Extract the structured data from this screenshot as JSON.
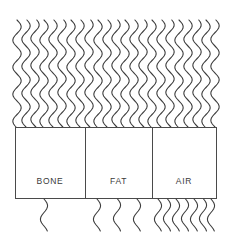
{
  "figure": {
    "type": "attenuation-diagram",
    "background_color": "#ffffff",
    "stroke_color": "#3d3d3d",
    "box_stroke_color": "#4a4a4a",
    "label_color": "#3a3a3a",
    "width": 235,
    "height": 233
  },
  "incident_beam": {
    "name": "incident-wavy-rays",
    "ray_count": 23,
    "x_start": 17,
    "x_end": 215,
    "y_top": 20,
    "y_bottom": 127,
    "wavelength": 27,
    "amplitude": 4.2
  },
  "materials": [
    {
      "label": "BONE",
      "x": 15,
      "width": 70,
      "transmitted_ray_count": 1,
      "transmitted_ray_positions": [
        44
      ]
    },
    {
      "label": "FAT",
      "x": 85,
      "width": 67,
      "transmitted_ray_count": 3,
      "transmitted_ray_positions": [
        97,
        117,
        137
      ]
    },
    {
      "label": "AIR",
      "x": 152,
      "width": 64,
      "transmitted_ray_count": 7,
      "transmitted_ray_positions": [
        158,
        167,
        176,
        185,
        194,
        203,
        211
      ]
    }
  ],
  "box_geometry": {
    "y_top": 127,
    "y_bottom": 198,
    "height": 71,
    "label_baseline_y": 182
  },
  "transmitted_beam": {
    "name": "transmitted-wavy-rays",
    "y_top": 199,
    "y_bottom": 231,
    "wavelength": 27,
    "amplitude": 3.6
  }
}
